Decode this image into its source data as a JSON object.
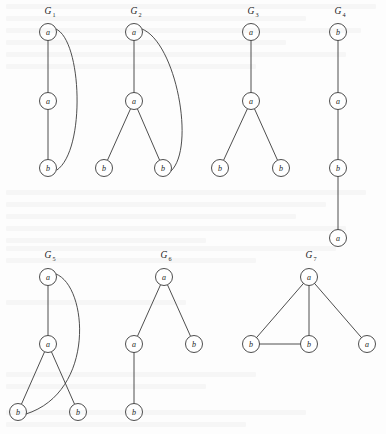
{
  "figure": {
    "caption": "",
    "background_color": "#fdfdfd",
    "stroke_color": "#3a3a3a",
    "node_fill": "#ffffff",
    "node_radius": 8.5,
    "graphs": [
      {
        "id": "G1",
        "name_base": "G",
        "name_sub": "1",
        "label_x": 48,
        "label_y": 14,
        "nodes": [
          {
            "id": "n1",
            "label": "a",
            "x": 48,
            "y": 32
          },
          {
            "id": "n2",
            "label": "a",
            "x": 48,
            "y": 101
          },
          {
            "id": "n3",
            "label": "b",
            "x": 48,
            "y": 168
          }
        ],
        "edges": [
          {
            "from": "n1",
            "to": "n2",
            "type": "line"
          },
          {
            "from": "n2",
            "to": "n3",
            "type": "line"
          },
          {
            "from": "n1",
            "to": "n3",
            "type": "curve",
            "path": "M 56 29 C 82 40, 86 150, 57 170"
          }
        ]
      },
      {
        "id": "G2",
        "name_base": "G",
        "name_sub": "2",
        "label_x": 134,
        "label_y": 14,
        "nodes": [
          {
            "id": "n1",
            "label": "a",
            "x": 134,
            "y": 32
          },
          {
            "id": "n2",
            "label": "a",
            "x": 134,
            "y": 101
          },
          {
            "id": "n3",
            "label": "b",
            "x": 104,
            "y": 168
          },
          {
            "id": "n4",
            "label": "b",
            "x": 163,
            "y": 168
          }
        ],
        "edges": [
          {
            "from": "n1",
            "to": "n2",
            "type": "line"
          },
          {
            "from": "n2",
            "to": "n3",
            "type": "line"
          },
          {
            "from": "n2",
            "to": "n4",
            "type": "line"
          },
          {
            "from": "n1",
            "to": "n4",
            "type": "curve",
            "path": "M 142 29 C 176 42, 196 148, 171 171"
          }
        ]
      },
      {
        "id": "G3",
        "name_base": "G",
        "name_sub": "3",
        "label_x": 251,
        "label_y": 14,
        "nodes": [
          {
            "id": "n1",
            "label": "a",
            "x": 251,
            "y": 32
          },
          {
            "id": "n2",
            "label": "a",
            "x": 251,
            "y": 101
          },
          {
            "id": "n3",
            "label": "b",
            "x": 220,
            "y": 168
          },
          {
            "id": "n4",
            "label": "b",
            "x": 281,
            "y": 168
          }
        ],
        "edges": [
          {
            "from": "n1",
            "to": "n2",
            "type": "line"
          },
          {
            "from": "n2",
            "to": "n3",
            "type": "line"
          },
          {
            "from": "n2",
            "to": "n4",
            "type": "line"
          }
        ]
      },
      {
        "id": "G4",
        "name_base": "G",
        "name_sub": "4",
        "label_x": 338,
        "label_y": 14,
        "nodes": [
          {
            "id": "n1",
            "label": "b",
            "x": 338,
            "y": 32
          },
          {
            "id": "n2",
            "label": "a",
            "x": 338,
            "y": 101
          },
          {
            "id": "n3",
            "label": "b",
            "x": 338,
            "y": 168
          },
          {
            "id": "n4",
            "label": "a",
            "x": 338,
            "y": 238
          }
        ],
        "edges": [
          {
            "from": "n1",
            "to": "n2",
            "type": "line"
          },
          {
            "from": "n2",
            "to": "n3",
            "type": "line"
          },
          {
            "from": "n3",
            "to": "n4",
            "type": "line"
          }
        ]
      },
      {
        "id": "G5",
        "name_base": "G",
        "name_sub": "5",
        "label_x": 48,
        "label_y": 258,
        "nodes": [
          {
            "id": "n1",
            "label": "a",
            "x": 48,
            "y": 277
          },
          {
            "id": "n2",
            "label": "a",
            "x": 48,
            "y": 344
          },
          {
            "id": "n3",
            "label": "b",
            "x": 18,
            "y": 412
          },
          {
            "id": "n4",
            "label": "b",
            "x": 78,
            "y": 412
          }
        ],
        "edges": [
          {
            "from": "n1",
            "to": "n2",
            "type": "line"
          },
          {
            "from": "n2",
            "to": "n3",
            "type": "line"
          },
          {
            "from": "n2",
            "to": "n4",
            "type": "line"
          },
          {
            "from": "n1",
            "to": "n3",
            "type": "curve",
            "path": "M 56 274 C 88 286, 96 392, 26 414"
          }
        ]
      },
      {
        "id": "G6",
        "name_base": "G",
        "name_sub": "6",
        "label_x": 164,
        "label_y": 258,
        "nodes": [
          {
            "id": "n1",
            "label": "a",
            "x": 164,
            "y": 277
          },
          {
            "id": "n2",
            "label": "a",
            "x": 134,
            "y": 344
          },
          {
            "id": "n3",
            "label": "b",
            "x": 194,
            "y": 344
          },
          {
            "id": "n4",
            "label": "b",
            "x": 134,
            "y": 412
          }
        ],
        "edges": [
          {
            "from": "n1",
            "to": "n2",
            "type": "line"
          },
          {
            "from": "n1",
            "to": "n3",
            "type": "line"
          },
          {
            "from": "n2",
            "to": "n4",
            "type": "line"
          }
        ]
      },
      {
        "id": "G7",
        "name_base": "G",
        "name_sub": "7",
        "label_x": 309,
        "label_y": 258,
        "nodes": [
          {
            "id": "n1",
            "label": "a",
            "x": 309,
            "y": 277
          },
          {
            "id": "n2",
            "label": "b",
            "x": 251,
            "y": 344
          },
          {
            "id": "n3",
            "label": "b",
            "x": 309,
            "y": 344
          },
          {
            "id": "n4",
            "label": "a",
            "x": 367,
            "y": 344
          }
        ],
        "edges": [
          {
            "from": "n1",
            "to": "n2",
            "type": "line"
          },
          {
            "from": "n1",
            "to": "n3",
            "type": "line"
          },
          {
            "from": "n1",
            "to": "n4",
            "type": "line"
          },
          {
            "from": "n2",
            "to": "n3",
            "type": "line"
          }
        ]
      }
    ]
  }
}
